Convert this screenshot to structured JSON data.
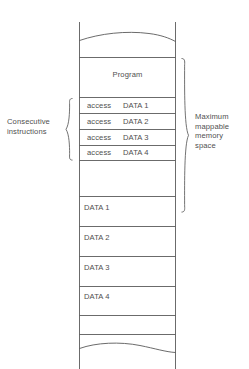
{
  "diagram": {
    "colors": {
      "line": "#5a5a5a",
      "text": "#4f4f4f",
      "background": "#ffffff"
    },
    "memory_column": {
      "top_break": "wavy-break-line",
      "bottom_break": "wavy-break-line",
      "sections": [
        {
          "name": "program",
          "label": "Program",
          "align": "center"
        },
        {
          "name": "empty-gap-upper",
          "label": ""
        },
        {
          "name": "data-1-block",
          "label": "DATA 1",
          "align": "left"
        },
        {
          "name": "data-2-block",
          "label": "DATA 2",
          "align": "left"
        },
        {
          "name": "data-3-block",
          "label": "DATA 3",
          "align": "left"
        },
        {
          "name": "data-4-block",
          "label": "DATA 4",
          "align": "left"
        }
      ]
    },
    "instructions": [
      {
        "verb": "access",
        "target": "DATA 1"
      },
      {
        "verb": "access",
        "target": "DATA 2"
      },
      {
        "verb": "access",
        "target": "DATA 3"
      },
      {
        "verb": "access",
        "target": "DATA 4"
      }
    ],
    "annotations": {
      "left": {
        "name": "consecutive-instructions",
        "line_1": "Consecutive",
        "line_2": "instructions",
        "brace": "left-curly-brace"
      },
      "right": {
        "name": "maximum-mappable-memory-space",
        "line_1": "Maximum",
        "line_2": "mappable",
        "line_3": "memory",
        "line_4": "space",
        "brace": "right-curly-brace"
      }
    }
  }
}
